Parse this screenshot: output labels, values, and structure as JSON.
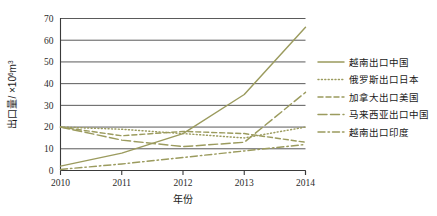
{
  "chart_data": {
    "type": "line",
    "title": "",
    "xlabel": "年份",
    "ylabel": "出口量/×10⁶m³",
    "ylabel_parts": {
      "main": "出口量/ ×10",
      "exponent": "6",
      "unit": "m",
      "unit_exponent": "3"
    },
    "categories": [
      "2010",
      "2011",
      "2012",
      "2013",
      "2014"
    ],
    "x": [
      2010,
      2011,
      2012,
      2013,
      2014
    ],
    "xlim": [
      2010,
      2014
    ],
    "ylim": [
      0,
      70
    ],
    "yticks": [
      "0",
      "10",
      "20",
      "30",
      "40",
      "50",
      "60",
      "70"
    ],
    "ytick_values": [
      0,
      10,
      20,
      30,
      40,
      50,
      60,
      70
    ],
    "grid": "horizontal",
    "legend_position": "right",
    "line_color": "#9b9b5e",
    "axis_color": "#3a3a3a",
    "grid_color": "#5a5a5a",
    "series": [
      {
        "name": "越南出口中国",
        "style": "solid",
        "dash": "none",
        "values": [
          2,
          8,
          17,
          35,
          66
        ]
      },
      {
        "name": "俄罗斯出口日本",
        "style": "dotted",
        "dash": "1,2.4",
        "values": [
          20,
          19,
          17,
          15,
          20
        ]
      },
      {
        "name": "加拿大出口美国",
        "style": "dashed",
        "dash": "5,3",
        "values": [
          20,
          16,
          18,
          17,
          13
        ]
      },
      {
        "name": "马来西亚出口中国",
        "style": "long-dash",
        "dash": "9,3.5",
        "values": [
          20,
          14,
          11,
          13,
          36
        ]
      },
      {
        "name": "越南出口印度",
        "style": "dash-dot",
        "dash": "7,3,1.5,3",
        "values": [
          0.5,
          3,
          6,
          9,
          12
        ]
      }
    ]
  }
}
